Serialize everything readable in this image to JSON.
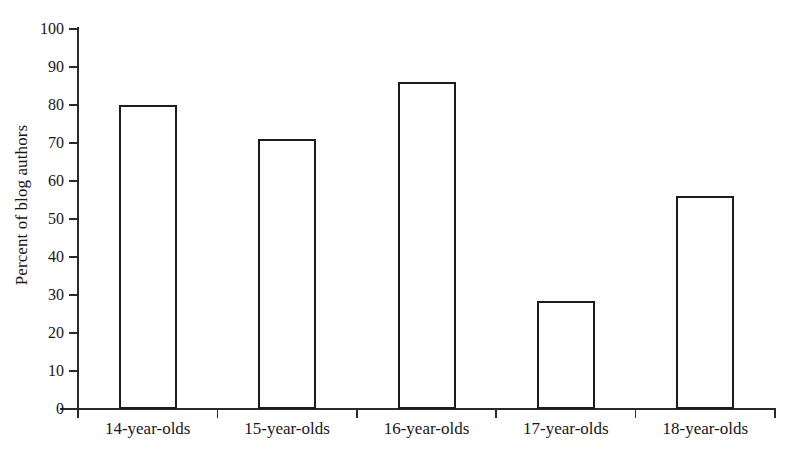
{
  "chart_data": {
    "type": "bar",
    "title": "",
    "subtitle": "",
    "xlabel": "",
    "ylabel": "Percent of blog authors",
    "categories": [
      "14-year-olds",
      "15-year-olds",
      "16-year-olds",
      "17-year-olds",
      "18-year-olds"
    ],
    "values": [
      80,
      71,
      86,
      28.5,
      56
    ],
    "ylim": [
      0,
      100
    ],
    "ytick_values": [
      0,
      10,
      20,
      30,
      40,
      50,
      60,
      70,
      80,
      90,
      100
    ],
    "ytick_labels": [
      "0",
      "10",
      "20",
      "30",
      "40",
      "50",
      "60",
      "70",
      "80",
      "90",
      "100"
    ],
    "grid": false,
    "legend": false,
    "legend_position": "none",
    "bar_fill_color": "#ffffff",
    "bar_edge_color": "#1c1c1c",
    "axis_color": "#2a2a2a",
    "background_color": "#ffffff",
    "series": [
      {
        "name": "Percent of blog authors",
        "values": [
          80,
          71,
          86,
          28.5,
          56
        ]
      }
    ]
  }
}
